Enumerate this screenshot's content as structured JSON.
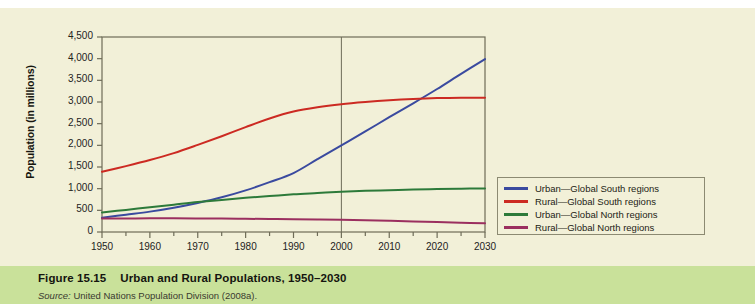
{
  "figure": {
    "number": "Figure 15.15",
    "title": "Urban and Rural Populations, 1950–2030",
    "source_label": "Source:",
    "source_text": " United Nations Population Division (2008a)."
  },
  "colors": {
    "panel_background": "#f2f0d8",
    "caption_band": "#c9e19a",
    "axis": "#6e6c58",
    "urban_south": "#3a4a9f",
    "rural_south": "#cc2a22",
    "urban_north": "#2d7a3a",
    "rural_north": "#9b2f5f"
  },
  "chart_data": {
    "type": "line",
    "title": "Urban and Rural Populations, 1950–2030",
    "xlabel": "",
    "ylabel": "Population (in millions)",
    "xlim": [
      1950,
      2030
    ],
    "ylim": [
      0,
      4500
    ],
    "ytick_step": 500,
    "grid": false,
    "legend_position": "right",
    "annotations": [
      {
        "type": "vertical-line",
        "x": 2000,
        "label": "2000"
      }
    ],
    "x": [
      1950,
      1955,
      1960,
      1965,
      1970,
      1975,
      1980,
      1985,
      1990,
      1995,
      2000,
      2005,
      2010,
      2015,
      2020,
      2025,
      2030
    ],
    "xtick_labels": [
      "1950",
      "1960",
      "1970",
      "1980",
      "1990",
      "2000",
      "2010",
      "2020",
      "2030"
    ],
    "ytick_labels": [
      "0",
      "500",
      "1,000",
      "1,500",
      "2,000",
      "2,500",
      "3,000",
      "3,500",
      "4,000",
      "4,500"
    ],
    "series": [
      {
        "name": "Urban—Global South regions",
        "color": "#3a4a9f",
        "values": [
          330,
          400,
          470,
          560,
          670,
          800,
          960,
          1150,
          1360,
          1680,
          2000,
          2320,
          2650,
          2970,
          3300,
          3650,
          3990
        ]
      },
      {
        "name": "Rural—Global South regions",
        "color": "#cc2a22",
        "values": [
          1390,
          1520,
          1660,
          1820,
          2010,
          2210,
          2420,
          2620,
          2780,
          2880,
          2950,
          3000,
          3040,
          3070,
          3090,
          3100,
          3100
        ]
      },
      {
        "name": "Urban—Global North regions",
        "color": "#2d7a3a",
        "values": [
          450,
          510,
          570,
          630,
          690,
          740,
          790,
          830,
          870,
          900,
          930,
          950,
          965,
          980,
          990,
          1000,
          1005
        ]
      },
      {
        "name": "Rural—Global North regions",
        "color": "#9b2f5f",
        "values": [
          310,
          312,
          315,
          315,
          313,
          310,
          305,
          300,
          295,
          288,
          280,
          270,
          258,
          245,
          230,
          215,
          200
        ]
      }
    ]
  },
  "legend": {
    "items": [
      {
        "label": "Urban—Global South regions",
        "color": "#3a4a9f"
      },
      {
        "label": "Rural—Global South regions",
        "color": "#cc2a22"
      },
      {
        "label": "Urban—Global North regions",
        "color": "#2d7a3a"
      },
      {
        "label": "Rural—Global North regions",
        "color": "#9b2f5f"
      }
    ]
  }
}
